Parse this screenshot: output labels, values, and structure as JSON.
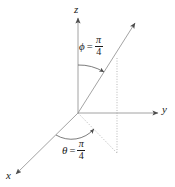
{
  "figure": {
    "type": "spherical-coordinates-diagram",
    "background_color": "#ffffff",
    "line_color": "#808080",
    "text_color": "#1a1a1a",
    "axes": [
      {
        "name": "z",
        "label": "z",
        "direction": "up"
      },
      {
        "name": "y",
        "label": "y",
        "direction": "right"
      },
      {
        "name": "x",
        "label": "x",
        "direction": "down-left"
      }
    ],
    "angles": [
      {
        "name": "phi",
        "symbol": "ϕ",
        "equals": "=",
        "numerator": "π",
        "denominator": "4",
        "measured_from": "z",
        "value_text": "ϕ = π/4"
      },
      {
        "name": "theta",
        "symbol": "θ",
        "equals": "=",
        "numerator": "π",
        "denominator": "4",
        "measured_from": "x",
        "value_text": "θ = π/4"
      }
    ],
    "ray": {
      "name": "position-ray",
      "description": "ray from origin up and to the right with arrowhead"
    },
    "projection": {
      "name": "projection-lines",
      "style": "dotted",
      "description": "vertical dotted drop line and dotted ground projection"
    }
  }
}
